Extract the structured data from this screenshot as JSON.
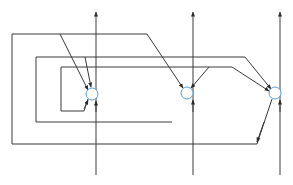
{
  "diagram": {
    "type": "flow-graph",
    "colors": {
      "line": "#3a3a3a",
      "node_stroke": "#5aa0d8",
      "node_fill": "#ffffff",
      "background": "#ffffff"
    },
    "vertical_axes": [
      {
        "id": "axis-left",
        "x": 96,
        "y_top": 13,
        "y_bottom": 175
      },
      {
        "id": "axis-middle",
        "x": 193,
        "y_top": 13,
        "y_bottom": 175
      },
      {
        "id": "axis-right",
        "x": 280,
        "y_top": 13,
        "y_bottom": 175
      }
    ],
    "nodes": [
      {
        "id": "node-left",
        "cx": 92,
        "cy": 94,
        "r": 6
      },
      {
        "id": "node-middle",
        "cx": 187,
        "cy": 93,
        "r": 6
      },
      {
        "id": "node-right",
        "cx": 275,
        "cy": 93,
        "r": 6
      }
    ],
    "labels": []
  }
}
